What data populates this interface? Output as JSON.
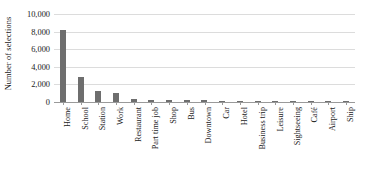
{
  "chart_data": {
    "type": "bar",
    "title": "",
    "xlabel": "",
    "ylabel": "Number of selections",
    "ylim": [
      0,
      10000
    ],
    "ytick_labels": [
      "10,000",
      "8,000",
      "6,000",
      "4,000",
      "2,000",
      "0"
    ],
    "ytick_values": [
      10000,
      8000,
      6000,
      4000,
      2000,
      0
    ],
    "grid": true,
    "legend": "none",
    "bar_color": "#6e6e6e",
    "gridline_color": "#dcdcdc",
    "axis_color": "#9a9a9a",
    "categories": [
      "Home",
      "School",
      "Station",
      "Work",
      "Restaurant",
      "Part time job",
      "Shop",
      "Bus",
      "Downtown",
      "Car",
      "Hotel",
      "Business trip",
      "Leisure",
      "Sightseeing",
      "Café",
      "Airport",
      "Ship"
    ],
    "values": [
      8150,
      2800,
      1200,
      1000,
      330,
      260,
      240,
      220,
      200,
      170,
      160,
      140,
      120,
      110,
      90,
      70,
      50
    ]
  }
}
